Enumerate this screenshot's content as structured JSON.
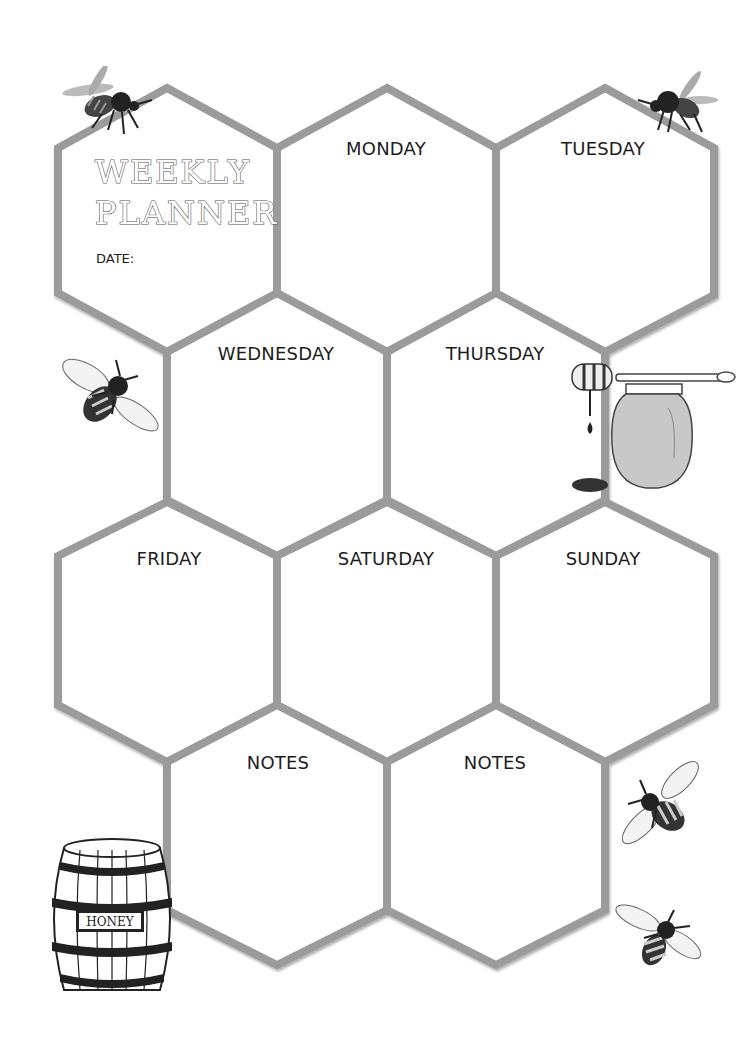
{
  "planner": {
    "title_line1": "WEEKLY",
    "title_line2": "PLANNER",
    "date_label": "DATE:"
  },
  "cells": [
    {
      "id": "title",
      "label": ""
    },
    {
      "id": "monday",
      "label": "MONDAY"
    },
    {
      "id": "tuesday",
      "label": "TUESDAY"
    },
    {
      "id": "wednesday",
      "label": "WEDNESDAY"
    },
    {
      "id": "thursday",
      "label": "THURSDAY"
    },
    {
      "id": "friday",
      "label": "FRIDAY"
    },
    {
      "id": "saturday",
      "label": "SATURDAY"
    },
    {
      "id": "sunday",
      "label": "SUNDAY"
    },
    {
      "id": "notes-1",
      "label": "NOTES"
    },
    {
      "id": "notes-2",
      "label": "NOTES"
    }
  ],
  "decorations": {
    "barrel_label": "HONEY"
  },
  "colors": {
    "hex_stroke": "#9b9b9b",
    "background": "#ffffff",
    "text": "#1d1d1d",
    "honey_jar_fill": "#c8c8c8"
  }
}
